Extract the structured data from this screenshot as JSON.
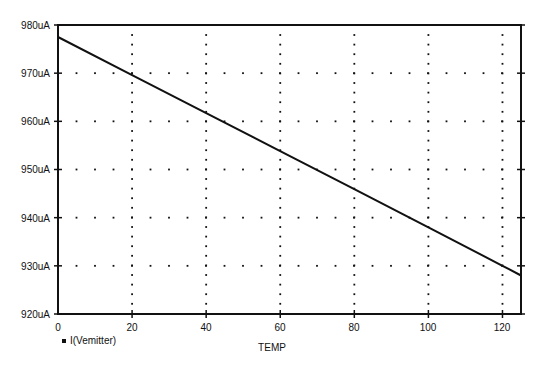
{
  "chart_data": {
    "type": "line",
    "title": "",
    "xlabel": "TEMP",
    "ylabel": "",
    "xlim": [
      0,
      125
    ],
    "ylim": [
      920,
      980
    ],
    "x_ticks": [
      0,
      20,
      40,
      60,
      80,
      100,
      120
    ],
    "y_ticks": [
      "920uA",
      "930uA",
      "940uA",
      "950uA",
      "960uA",
      "970uA",
      "980uA"
    ],
    "y_tick_values": [
      920,
      930,
      940,
      950,
      960,
      970,
      980
    ],
    "grid": "dotted",
    "legend": [
      {
        "marker": "square",
        "label": "I(Vemitter)"
      }
    ],
    "legend_position": "bottom-left",
    "series": [
      {
        "name": "I(Vemitter)",
        "unit": "uA",
        "x": [
          0,
          20,
          40,
          60,
          80,
          100,
          120,
          125
        ],
        "values": [
          977.5,
          969.6,
          961.7,
          953.8,
          945.9,
          938.0,
          930.0,
          928.0
        ]
      }
    ]
  },
  "labels": {
    "xlabel": "TEMP",
    "legend_item": "I(Vemitter)",
    "y_ticks": [
      "980uA",
      "970uA",
      "960uA",
      "950uA",
      "940uA",
      "930uA",
      "920uA"
    ],
    "x_ticks": [
      "0",
      "20",
      "40",
      "60",
      "80",
      "100",
      "120"
    ]
  },
  "colors": {
    "line": "#111111",
    "grid": "#111111",
    "background": "#ffffff"
  }
}
